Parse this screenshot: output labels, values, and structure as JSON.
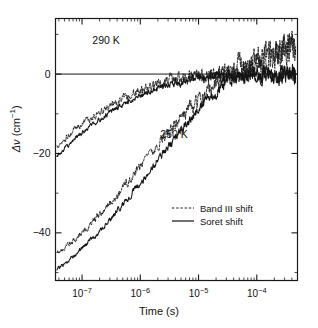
{
  "figure": {
    "title": "",
    "background": "#ffffff",
    "foreground": "#111111"
  },
  "axes": {
    "xlabel": "Time (s)",
    "ylabel_prefix": "Δ",
    "ylabel_var": "ν",
    "ylabel_unit": "(cm",
    "ylabel_unit_exp": "−1",
    "ylabel_unit_close": ")",
    "x_ticklabels": [
      {
        "mantissa": "10",
        "exponent": "−7",
        "value": 1e-07
      },
      {
        "mantissa": "10",
        "exponent": "−6",
        "value": 1e-06
      },
      {
        "mantissa": "10",
        "exponent": "−5",
        "value": 1e-05
      },
      {
        "mantissa": "10",
        "exponent": "−4",
        "value": 0.0001
      }
    ],
    "y_ticklabels": [
      "0",
      "−20",
      "−40"
    ],
    "y_tickvalues": [
      0,
      -20,
      -40
    ]
  },
  "annotations": [
    {
      "text": "290 K",
      "x": 1.5e-07,
      "y": 7.5
    },
    {
      "text": "250 K",
      "x": 2.2e-06,
      "y": -16.0
    }
  ],
  "legend": {
    "position": "lower-right-inside",
    "entries": [
      {
        "label": "Band III shift",
        "style": "dashed",
        "color": "#111111"
      },
      {
        "label": "Soret shift",
        "style": "solid",
        "color": "#111111"
      }
    ]
  },
  "chart_data": {
    "type": "line",
    "title": "",
    "xlabel": "Time (s)",
    "ylabel": "Δν (cm⁻¹)",
    "xscale": "log",
    "yscale": "linear",
    "xlim": [
      3.5e-08,
      0.0005
    ],
    "ylim": [
      -52,
      14
    ],
    "grid": false,
    "zero_line": true,
    "legend_entries": [
      "Band III shift",
      "Soret shift"
    ],
    "series": [
      {
        "name": "290 K Band III shift",
        "temperature_K": 290,
        "style": "dashed",
        "x": [
          3.7e-08,
          4.6e-08,
          5.8e-08,
          7.3e-08,
          9.2e-08,
          1.16e-07,
          1.46e-07,
          1.84e-07,
          2.31e-07,
          2.91e-07,
          3.67e-07,
          4.62e-07,
          5.81e-07,
          7.32e-07,
          9.21e-07,
          1.16e-06,
          1.46e-06,
          1.84e-06,
          2.32e-06,
          2.92e-06,
          3.67e-06,
          4.63e-06,
          5.83e-06,
          7.33e-06,
          9.23e-06,
          1.16e-05,
          1.46e-05,
          1.84e-05,
          2.32e-05,
          2.92e-05,
          3.68e-05,
          4.63e-05,
          5.83e-05,
          7.34e-05,
          9.24e-05,
          0.000116,
          0.000147,
          0.000185,
          0.000233,
          0.000293,
          0.000369,
          0.000464
        ],
        "y": [
          -18.4,
          -17.1,
          -15.6,
          -14.2,
          -13.1,
          -12.0,
          -11.0,
          -10.1,
          -9.1,
          -8.2,
          -7.4,
          -6.6,
          -5.8,
          -5.1,
          -4.4,
          -3.8,
          -3.2,
          -2.7,
          -2.2,
          -1.8,
          -1.4,
          -1.1,
          -0.8,
          -0.5,
          -0.3,
          -0.2,
          0.0,
          0.2,
          0.6,
          0.9,
          1.3,
          1.8,
          2.2,
          2.7,
          3.2,
          3.8,
          4.3,
          4.9,
          5.5,
          6.1,
          6.7,
          7.3
        ],
        "noise_amplitude": 1.9
      },
      {
        "name": "290 K Soret shift",
        "temperature_K": 290,
        "style": "solid",
        "x": [
          3.7e-08,
          4.6e-08,
          5.8e-08,
          7.3e-08,
          9.2e-08,
          1.16e-07,
          1.46e-07,
          1.84e-07,
          2.31e-07,
          2.91e-07,
          3.67e-07,
          4.62e-07,
          5.81e-07,
          7.32e-07,
          9.21e-07,
          1.16e-06,
          1.46e-06,
          1.84e-06,
          2.32e-06,
          2.92e-06,
          3.67e-06,
          4.63e-06,
          5.83e-06,
          7.33e-06,
          9.23e-06,
          1.16e-05,
          1.46e-05,
          1.84e-05,
          2.32e-05,
          2.92e-05,
          3.68e-05,
          4.63e-05,
          5.83e-05,
          7.34e-05,
          9.24e-05,
          0.000116,
          0.000147,
          0.000185,
          0.000233,
          0.000293,
          0.000369,
          0.000464
        ],
        "y": [
          -20.6,
          -19.3,
          -17.9,
          -16.5,
          -15.2,
          -14.0,
          -12.9,
          -11.8,
          -10.8,
          -9.8,
          -8.9,
          -8.0,
          -7.2,
          -6.4,
          -5.7,
          -5.0,
          -4.4,
          -3.8,
          -3.3,
          -2.8,
          -2.4,
          -2.0,
          -1.7,
          -1.4,
          -1.1,
          -0.9,
          -0.7,
          -0.6,
          -0.5,
          -0.4,
          -0.4,
          -0.3,
          -0.3,
          -0.3,
          -0.2,
          -0.2,
          -0.2,
          -0.2,
          -0.2,
          -0.1,
          -0.1,
          -0.1
        ],
        "noise_amplitude": 1.1
      },
      {
        "name": "250 K Band III shift",
        "temperature_K": 250,
        "style": "dashed",
        "x": [
          3.7e-08,
          4.6e-08,
          5.8e-08,
          7.3e-08,
          9.2e-08,
          1.16e-07,
          1.46e-07,
          1.84e-07,
          2.31e-07,
          2.91e-07,
          3.67e-07,
          4.62e-07,
          5.81e-07,
          7.32e-07,
          9.21e-07,
          1.16e-06,
          1.46e-06,
          1.84e-06,
          2.32e-06,
          2.92e-06,
          3.67e-06,
          4.63e-06,
          5.83e-06,
          7.33e-06,
          9.23e-06,
          1.16e-05,
          1.46e-05,
          1.84e-05,
          2.32e-05,
          2.92e-05,
          3.68e-05,
          4.63e-05,
          5.83e-05,
          7.34e-05,
          9.24e-05,
          0.000116,
          0.000147,
          0.000185,
          0.000233,
          0.000293,
          0.000369,
          0.000464
        ],
        "y": [
          -45.4,
          -44.2,
          -43.0,
          -41.7,
          -40.4,
          -39.0,
          -37.5,
          -36.0,
          -34.4,
          -32.8,
          -31.1,
          -29.4,
          -27.6,
          -25.8,
          -24.0,
          -22.2,
          -20.4,
          -18.6,
          -16.8,
          -15.0,
          -13.3,
          -11.6,
          -10.0,
          -8.4,
          -6.9,
          -5.5,
          -4.2,
          -3.0,
          -2.0,
          -1.1,
          -0.4,
          0.3,
          1.0,
          1.7,
          2.4,
          3.1,
          3.8,
          4.5,
          5.2,
          5.9,
          6.5,
          7.1
        ],
        "noise_amplitude": 1.8
      },
      {
        "name": "250 K Soret shift",
        "temperature_K": 250,
        "style": "solid",
        "x": [
          3.7e-08,
          4.6e-08,
          5.8e-08,
          7.3e-08,
          9.2e-08,
          1.16e-07,
          1.46e-07,
          1.84e-07,
          2.31e-07,
          2.91e-07,
          3.67e-07,
          4.62e-07,
          5.81e-07,
          7.32e-07,
          9.21e-07,
          1.16e-06,
          1.46e-06,
          1.84e-06,
          2.32e-06,
          2.92e-06,
          3.67e-06,
          4.63e-06,
          5.83e-06,
          7.33e-06,
          9.23e-06,
          1.16e-05,
          1.46e-05,
          1.84e-05,
          2.32e-05,
          2.92e-05,
          3.68e-05,
          4.63e-05,
          5.83e-05,
          7.34e-05,
          9.24e-05,
          0.000116,
          0.000147,
          0.000185,
          0.000233,
          0.000293,
          0.000369,
          0.000464
        ],
        "y": [
          -49.3,
          -48.2,
          -47.0,
          -45.7,
          -44.4,
          -43.0,
          -41.6,
          -40.1,
          -38.5,
          -36.9,
          -35.2,
          -33.5,
          -31.7,
          -29.9,
          -28.1,
          -26.3,
          -24.4,
          -22.5,
          -20.6,
          -18.7,
          -16.8,
          -15.0,
          -13.2,
          -11.4,
          -9.7,
          -8.0,
          -6.4,
          -4.9,
          -3.6,
          -2.5,
          -1.6,
          -1.0,
          -0.6,
          -0.4,
          -0.3,
          -0.2,
          -0.2,
          -0.2,
          -0.2,
          -0.1,
          -0.1,
          -0.1
        ],
        "noise_amplitude": 1.2
      }
    ]
  }
}
